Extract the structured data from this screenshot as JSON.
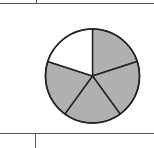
{
  "figure": {
    "type": "fraction-pie",
    "total_parts": 5,
    "shaded_parts": 4,
    "unshaded_parts": 1,
    "colors": {
      "shaded": "#b0b0b0",
      "unshaded": "#ffffff",
      "stroke": "#222222",
      "table_lines": "#555555"
    }
  },
  "chart_data": {
    "type": "pie",
    "categories": [
      "slice1",
      "slice2",
      "slice3",
      "slice4",
      "slice5"
    ],
    "values": [
      1,
      1,
      1,
      1,
      1
    ],
    "shaded": [
      true,
      true,
      true,
      true,
      false
    ],
    "title": "",
    "annotations": []
  }
}
